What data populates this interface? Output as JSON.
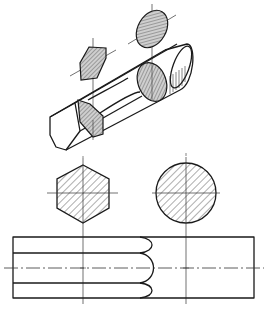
{
  "figure": {
    "stroke_color": "#1a1a1a",
    "background": "#ffffff",
    "views": [
      {
        "id": "isometric",
        "label": "Isometric view of bar with hexagonal end and round body, with removed sections"
      },
      {
        "id": "section-hex",
        "label": "Hexagonal cross-section (hatched)"
      },
      {
        "id": "section-round",
        "label": "Circular cross-section (hatched)"
      },
      {
        "id": "front-view",
        "label": "Front elevation showing hex-to-round transition curves"
      }
    ]
  }
}
